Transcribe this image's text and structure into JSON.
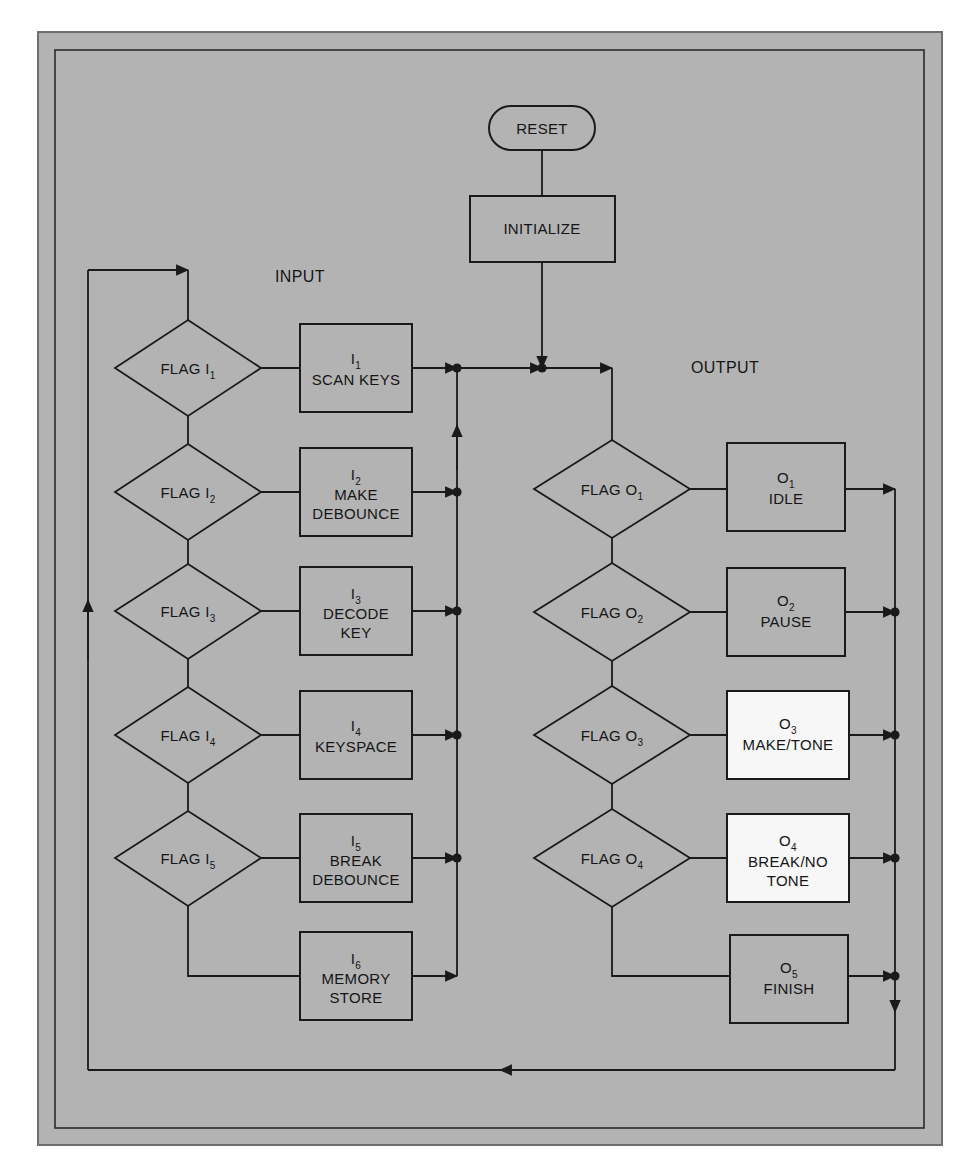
{
  "figure": {
    "panel_bg": "#b3b3b3",
    "line_color": "#1a1a1a",
    "highlight_fill": "#f7f7f7"
  },
  "labels": {
    "input_section": "INPUT",
    "output_section": "OUTPUT"
  },
  "start": {
    "terminator": "RESET",
    "process": "INITIALIZE"
  },
  "input_branch": {
    "decisions": [
      {
        "id": "flag-i1",
        "label": "FLAG I",
        "sub": "1"
      },
      {
        "id": "flag-i2",
        "label": "FLAG I",
        "sub": "2"
      },
      {
        "id": "flag-i3",
        "label": "FLAG I",
        "sub": "3"
      },
      {
        "id": "flag-i4",
        "label": "FLAG I",
        "sub": "4"
      },
      {
        "id": "flag-i5",
        "label": "FLAG I",
        "sub": "5"
      }
    ],
    "processes": [
      {
        "id": "i1",
        "tag": "I",
        "sub": "1",
        "lines": [
          "SCAN KEYS"
        ],
        "fill": "#b3b3b3"
      },
      {
        "id": "i2",
        "tag": "I",
        "sub": "2",
        "lines": [
          "MAKE",
          "DEBOUNCE"
        ],
        "fill": "#b3b3b3"
      },
      {
        "id": "i3",
        "tag": "I",
        "sub": "3",
        "lines": [
          "DECODE",
          "KEY"
        ],
        "fill": "#b3b3b3"
      },
      {
        "id": "i4",
        "tag": "I",
        "sub": "4",
        "lines": [
          "KEYSPACE"
        ],
        "fill": "#b3b3b3"
      },
      {
        "id": "i5",
        "tag": "I",
        "sub": "5",
        "lines": [
          "BREAK",
          "DEBOUNCE"
        ],
        "fill": "#b3b3b3"
      },
      {
        "id": "i6",
        "tag": "I",
        "sub": "6",
        "lines": [
          "MEMORY",
          "STORE"
        ],
        "fill": "#b3b3b3"
      }
    ]
  },
  "output_branch": {
    "decisions": [
      {
        "id": "flag-o1",
        "label": "FLAG O",
        "sub": "1"
      },
      {
        "id": "flag-o2",
        "label": "FLAG O",
        "sub": "2"
      },
      {
        "id": "flag-o3",
        "label": "FLAG O",
        "sub": "3"
      },
      {
        "id": "flag-o4",
        "label": "FLAG O",
        "sub": "4"
      }
    ],
    "processes": [
      {
        "id": "o1",
        "tag": "O",
        "sub": "1",
        "lines": [
          "IDLE"
        ],
        "fill": "#b3b3b3"
      },
      {
        "id": "o2",
        "tag": "O",
        "sub": "2",
        "lines": [
          "PAUSE"
        ],
        "fill": "#b3b3b3"
      },
      {
        "id": "o3",
        "tag": "O",
        "sub": "3",
        "lines": [
          "MAKE/TONE"
        ],
        "fill": "#f7f7f7"
      },
      {
        "id": "o4",
        "tag": "O",
        "sub": "4",
        "lines": [
          "BREAK/NO",
          "TONE"
        ],
        "fill": "#f7f7f7"
      },
      {
        "id": "o5",
        "tag": "O",
        "sub": "5",
        "lines": [
          "FINISH"
        ],
        "fill": "#b3b3b3"
      }
    ]
  }
}
